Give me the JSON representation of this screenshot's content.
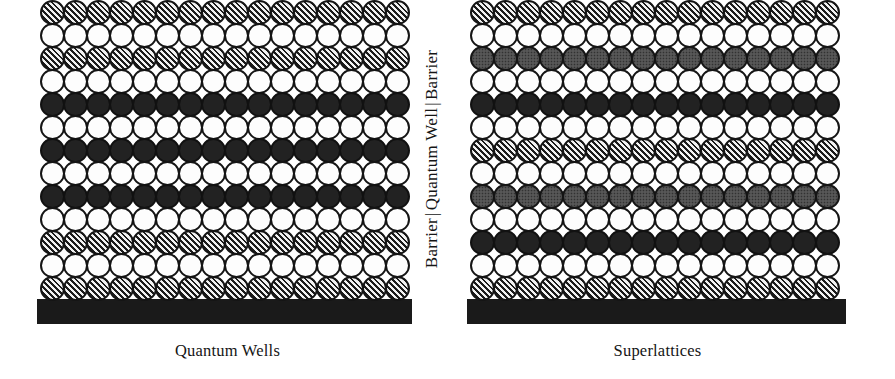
{
  "figure": {
    "center_label": {
      "barrier_left": "Barrier",
      "separator_left": "|",
      "quantum_well": "Quantum Well",
      "separator_right": "|",
      "barrier_right": "Barrier"
    }
  },
  "colors": {
    "substrate": "#1a1a1a",
    "atom_outline": "#151515",
    "atom_white": "#fdfdfd",
    "atom_black": "#222222",
    "atom_gray": "#7c7c7c",
    "atom_hatched": "#e8e8e8",
    "text": "#151515",
    "background": "#ffffff"
  },
  "diagram_data": {
    "type": "diagram",
    "subject": "Semiconductor heterostructure layer schematics",
    "atom_fill_legend": {
      "white": "host / well material atom (open circle)",
      "hatched": "barrier material atom (diagonal hatch)",
      "black": "dopant or second-species atom (solid fill)",
      "gray": "third-species atom (gray stipple fill)"
    },
    "grid": {
      "columns": 16,
      "rows": 13,
      "atom_diameter_px": 25,
      "column_pitch_px": 23,
      "row_pitch_px": 23
    },
    "structures": [
      {
        "caption": "Quantum Wells",
        "rows": [
          "hatched",
          "white",
          "hatched",
          "white",
          "black",
          "white",
          "black",
          "white",
          "black",
          "white",
          "hatched",
          "white",
          "hatched"
        ],
        "row_count": 13,
        "column_count": 16,
        "description": "Single thick quantum well region (solid/black alternating layers) sandwiched between hatched barrier layers at top and bottom."
      },
      {
        "caption": "Superlattices",
        "rows": [
          "hatched",
          "white",
          "gray",
          "white",
          "black",
          "white",
          "hatched",
          "white",
          "gray",
          "white",
          "black",
          "white",
          "hatched"
        ],
        "row_count": 13,
        "column_count": 16,
        "description": "Periodically repeating sequence of hatched, gray and solid layers forming a superlattice with repeating barrier/well period."
      }
    ]
  },
  "left_structure": {
    "caption": "Quantum Wells",
    "rows": [
      "hatched",
      "white",
      "hatched",
      "white",
      "black",
      "white",
      "black",
      "white",
      "black",
      "white",
      "hatched",
      "white",
      "hatched"
    ]
  },
  "right_structure": {
    "caption": "Superlattices",
    "rows": [
      "hatched",
      "white",
      "gray",
      "white",
      "black",
      "white",
      "hatched",
      "white",
      "gray",
      "white",
      "black",
      "white",
      "hatched"
    ]
  }
}
